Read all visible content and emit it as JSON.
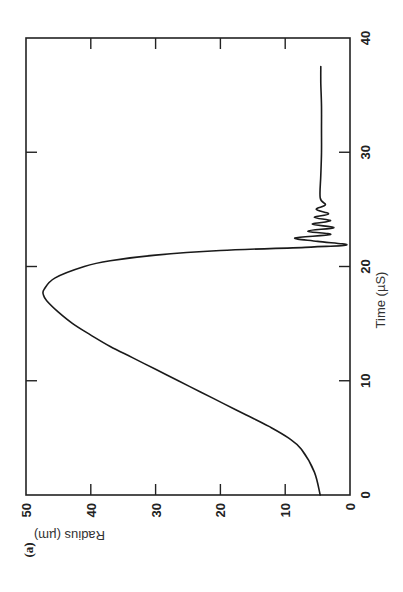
{
  "panel_label": "(a)",
  "chart_data": {
    "type": "line",
    "title": "",
    "xlabel": "Time (µS)",
    "ylabel": "Radius (µm)",
    "xlim": [
      0,
      40
    ],
    "ylim": [
      0,
      50
    ],
    "xticks": [
      0,
      10,
      20,
      30,
      40
    ],
    "yticks": [
      0,
      10,
      20,
      30,
      40,
      50
    ],
    "xtick_labels": [
      "0",
      "10",
      "20",
      "30",
      "40"
    ],
    "ytick_labels": [
      "0",
      "10",
      "20",
      "30",
      "40",
      "50"
    ],
    "grid": false,
    "legend": null,
    "orientation": "rotated 90° counter-clockwise on page",
    "series": [
      {
        "name": "bubble radius",
        "x": [
          0,
          2,
          4,
          5,
          6,
          7,
          8,
          9,
          10,
          11,
          12,
          13,
          14,
          15,
          16,
          17,
          17.5,
          18,
          19,
          20,
          20.5,
          21,
          21.4,
          21.7,
          21.9,
          22.2,
          22.5,
          22.8,
          23.1,
          23.4,
          23.7,
          24.0,
          24.3,
          24.6,
          25.0,
          25.4,
          26.0,
          28,
          30,
          32,
          34,
          36,
          37.5
        ],
        "y": [
          4.6,
          5.5,
          7.5,
          9.5,
          12.5,
          16,
          19.5,
          23,
          26.5,
          30,
          33.5,
          37,
          40,
          42.8,
          45,
          46.8,
          47.3,
          47.2,
          45.5,
          41,
          37,
          30,
          20,
          6,
          0.5,
          5,
          8.5,
          3,
          6.5,
          2.5,
          5.8,
          3,
          5.5,
          3.3,
          5.2,
          3.8,
          4.6,
          4.5,
          4.4,
          4.4,
          4.4,
          4.5,
          4.5
        ]
      }
    ],
    "annotations": [
      "(a)"
    ]
  }
}
